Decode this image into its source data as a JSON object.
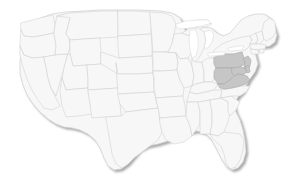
{
  "map": {
    "title": "United States Choropleth Map",
    "region_scope": "Contiguous United States",
    "projection_hint": "albers-usa",
    "background_color": "#ffffff",
    "default_state_fill": "#f7f7f7",
    "highlight_fill": "#c6c6c6",
    "border_color": "#d0d0d0",
    "highlight_border_color": "#a8a8a8",
    "shadow_color": "#8f8f8f",
    "legend_visible": false,
    "labels_visible": false,
    "highlighted_states": [
      "Pennsylvania",
      "West Virginia",
      "Virginia",
      "Maryland",
      "Delaware",
      "New Jersey"
    ],
    "states": [
      {
        "code": "WA",
        "name": "Washington",
        "highlighted": false
      },
      {
        "code": "OR",
        "name": "Oregon",
        "highlighted": false
      },
      {
        "code": "CA",
        "name": "California",
        "highlighted": false
      },
      {
        "code": "NV",
        "name": "Nevada",
        "highlighted": false
      },
      {
        "code": "ID",
        "name": "Idaho",
        "highlighted": false
      },
      {
        "code": "MT",
        "name": "Montana",
        "highlighted": false
      },
      {
        "code": "WY",
        "name": "Wyoming",
        "highlighted": false
      },
      {
        "code": "UT",
        "name": "Utah",
        "highlighted": false
      },
      {
        "code": "AZ",
        "name": "Arizona",
        "highlighted": false
      },
      {
        "code": "CO",
        "name": "Colorado",
        "highlighted": false
      },
      {
        "code": "NM",
        "name": "New Mexico",
        "highlighted": false
      },
      {
        "code": "ND",
        "name": "North Dakota",
        "highlighted": false
      },
      {
        "code": "SD",
        "name": "South Dakota",
        "highlighted": false
      },
      {
        "code": "NE",
        "name": "Nebraska",
        "highlighted": false
      },
      {
        "code": "KS",
        "name": "Kansas",
        "highlighted": false
      },
      {
        "code": "OK",
        "name": "Oklahoma",
        "highlighted": false
      },
      {
        "code": "TX",
        "name": "Texas",
        "highlighted": false
      },
      {
        "code": "MN",
        "name": "Minnesota",
        "highlighted": false
      },
      {
        "code": "IA",
        "name": "Iowa",
        "highlighted": false
      },
      {
        "code": "MO",
        "name": "Missouri",
        "highlighted": false
      },
      {
        "code": "AR",
        "name": "Arkansas",
        "highlighted": false
      },
      {
        "code": "LA",
        "name": "Louisiana",
        "highlighted": false
      },
      {
        "code": "WI",
        "name": "Wisconsin",
        "highlighted": false
      },
      {
        "code": "IL",
        "name": "Illinois",
        "highlighted": false
      },
      {
        "code": "MI",
        "name": "Michigan",
        "highlighted": false
      },
      {
        "code": "IN",
        "name": "Indiana",
        "highlighted": false
      },
      {
        "code": "OH",
        "name": "Ohio",
        "highlighted": false
      },
      {
        "code": "KY",
        "name": "Kentucky",
        "highlighted": false
      },
      {
        "code": "TN",
        "name": "Tennessee",
        "highlighted": false
      },
      {
        "code": "MS",
        "name": "Mississippi",
        "highlighted": false
      },
      {
        "code": "AL",
        "name": "Alabama",
        "highlighted": false
      },
      {
        "code": "GA",
        "name": "Georgia",
        "highlighted": false
      },
      {
        "code": "FL",
        "name": "Florida",
        "highlighted": false
      },
      {
        "code": "SC",
        "name": "South Carolina",
        "highlighted": false
      },
      {
        "code": "NC",
        "name": "North Carolina",
        "highlighted": false
      },
      {
        "code": "VA",
        "name": "Virginia",
        "highlighted": true
      },
      {
        "code": "WV",
        "name": "West Virginia",
        "highlighted": true
      },
      {
        "code": "MD",
        "name": "Maryland",
        "highlighted": true
      },
      {
        "code": "DE",
        "name": "Delaware",
        "highlighted": true
      },
      {
        "code": "PA",
        "name": "Pennsylvania",
        "highlighted": true
      },
      {
        "code": "NJ",
        "name": "New Jersey",
        "highlighted": true
      },
      {
        "code": "NY",
        "name": "New York",
        "highlighted": false
      },
      {
        "code": "CT",
        "name": "Connecticut",
        "highlighted": false
      },
      {
        "code": "RI",
        "name": "Rhode Island",
        "highlighted": false
      },
      {
        "code": "MA",
        "name": "Massachusetts",
        "highlighted": false
      },
      {
        "code": "VT",
        "name": "Vermont",
        "highlighted": false
      },
      {
        "code": "NH",
        "name": "New Hampshire",
        "highlighted": false
      },
      {
        "code": "ME",
        "name": "Maine",
        "highlighted": false
      }
    ]
  }
}
